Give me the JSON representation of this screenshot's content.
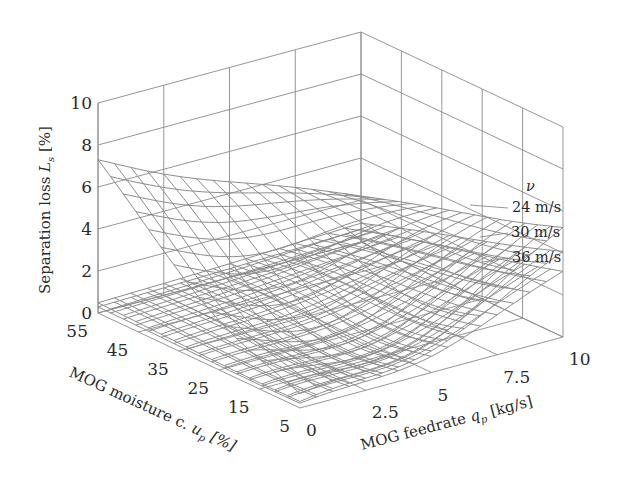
{
  "chart_data": {
    "type": "surface3d",
    "title": "",
    "zlabel": "Separation loss L_s [%]",
    "zlabel_main": "Separation loss ",
    "zlabel_var": "L",
    "zlabel_sub": "s",
    "zlabel_unit": " [%]",
    "ylabel": "MOG moisture c. u_p [%]",
    "ylabel_main": "MOG moisture c. ",
    "ylabel_var": "u",
    "ylabel_sub": "p",
    "ylabel_unit": " [%]",
    "xlabel": "MOG feedrate q_p [kg/s]",
    "xlabel_main": "MOG feedrate ",
    "xlabel_var": "q",
    "xlabel_sub": "p",
    "xlabel_unit": " [kg/s]",
    "x_ticks": [
      "0",
      "2.5",
      "5",
      "7.5",
      "10"
    ],
    "x_range": [
      0,
      10
    ],
    "y_ticks": [
      "55",
      "45",
      "35",
      "25",
      "15",
      "5"
    ],
    "y_range": [
      5,
      55
    ],
    "z_ticks": [
      "0",
      "2",
      "4",
      "6",
      "8",
      "10"
    ],
    "z_range": [
      0,
      10
    ],
    "grid": true,
    "legend": {
      "title": "ν",
      "position": "right",
      "entries": [
        "24 m/s",
        "30 m/s",
        "36 m/s"
      ]
    },
    "series": [
      {
        "name": "24 m/s",
        "description": "Bowl-shaped surface; minimum ~0.2% near q_p≈3.5 kg/s, u_p≈15%; rises to ~7.6% at q_p=0, u_p=55 and ~5.5% at q_p=10, u_p=5",
        "corners": {
          "q0_u55": 7.6,
          "q10_u55": 2.2,
          "q0_u5": 0.9,
          "q10_u5": 5.5
        },
        "min": {
          "q": 3.5,
          "u": 17,
          "z": 0.2
        }
      },
      {
        "name": "30 m/s",
        "corners": {
          "q0_u55": 0.5,
          "q10_u55": 0.9,
          "q0_u5": 0.4,
          "q10_u5": 4.3
        },
        "min": {
          "q": 3.5,
          "u": 17,
          "z": 0.1
        }
      },
      {
        "name": "36 m/s",
        "corners": {
          "q0_u55": 0.3,
          "q10_u55": 0.6,
          "q0_u5": 0.3,
          "q10_u5": 3.3
        },
        "min": {
          "q": 3.5,
          "u": 17,
          "z": 0.05
        }
      }
    ],
    "mesh": {
      "x_lines": 16,
      "y_lines": 16
    }
  },
  "colors": {
    "background": "#ffffff",
    "grid": "#8a8a8a",
    "mesh": "#8c8c8c",
    "text": "#2a2a2a"
  }
}
